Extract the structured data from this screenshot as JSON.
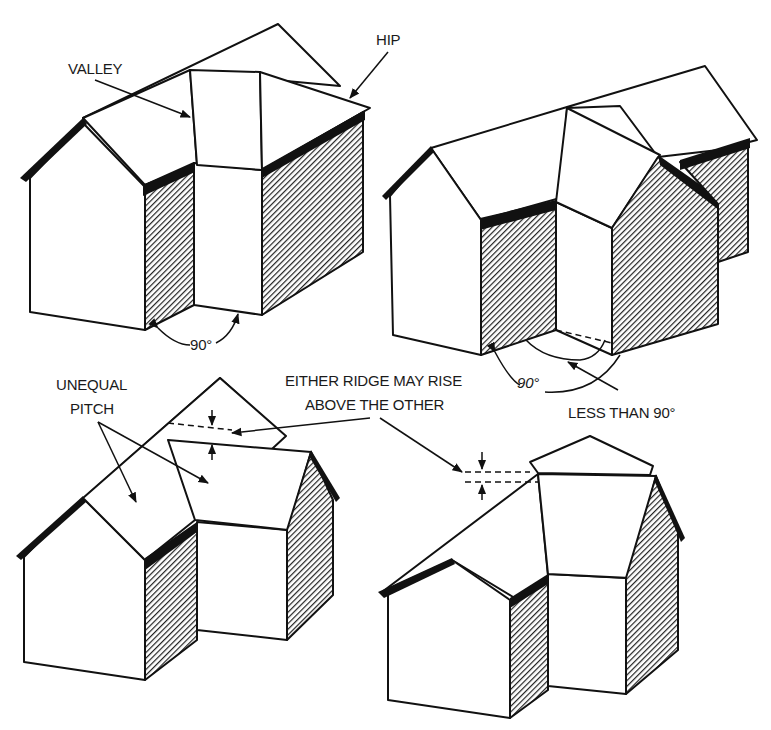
{
  "figure": {
    "panels": [
      {
        "id": "top-left",
        "description": "Intersecting gable roofs at 90 degrees with hip",
        "labels": {
          "valley": "VALLEY",
          "hip": "HIP",
          "angle": "90°"
        }
      },
      {
        "id": "top-right",
        "description": "Intersecting gable roofs at less than 90 degrees",
        "labels": {
          "angle": "90°",
          "less_than": "LESS THAN 90°"
        }
      },
      {
        "id": "bottom-left",
        "description": "Unequal pitch roofs",
        "labels": {
          "pitch_line1": "UNEQUAL",
          "pitch_line2": "PITCH"
        }
      },
      {
        "id": "bottom-right",
        "description": "Ridge heights differ"
      }
    ],
    "shared_label": {
      "line1": "EITHER RIDGE MAY RISE",
      "line2": "ABOVE THE OTHER"
    },
    "colors": {
      "ink": "#111111",
      "paper": "#ffffff"
    }
  }
}
